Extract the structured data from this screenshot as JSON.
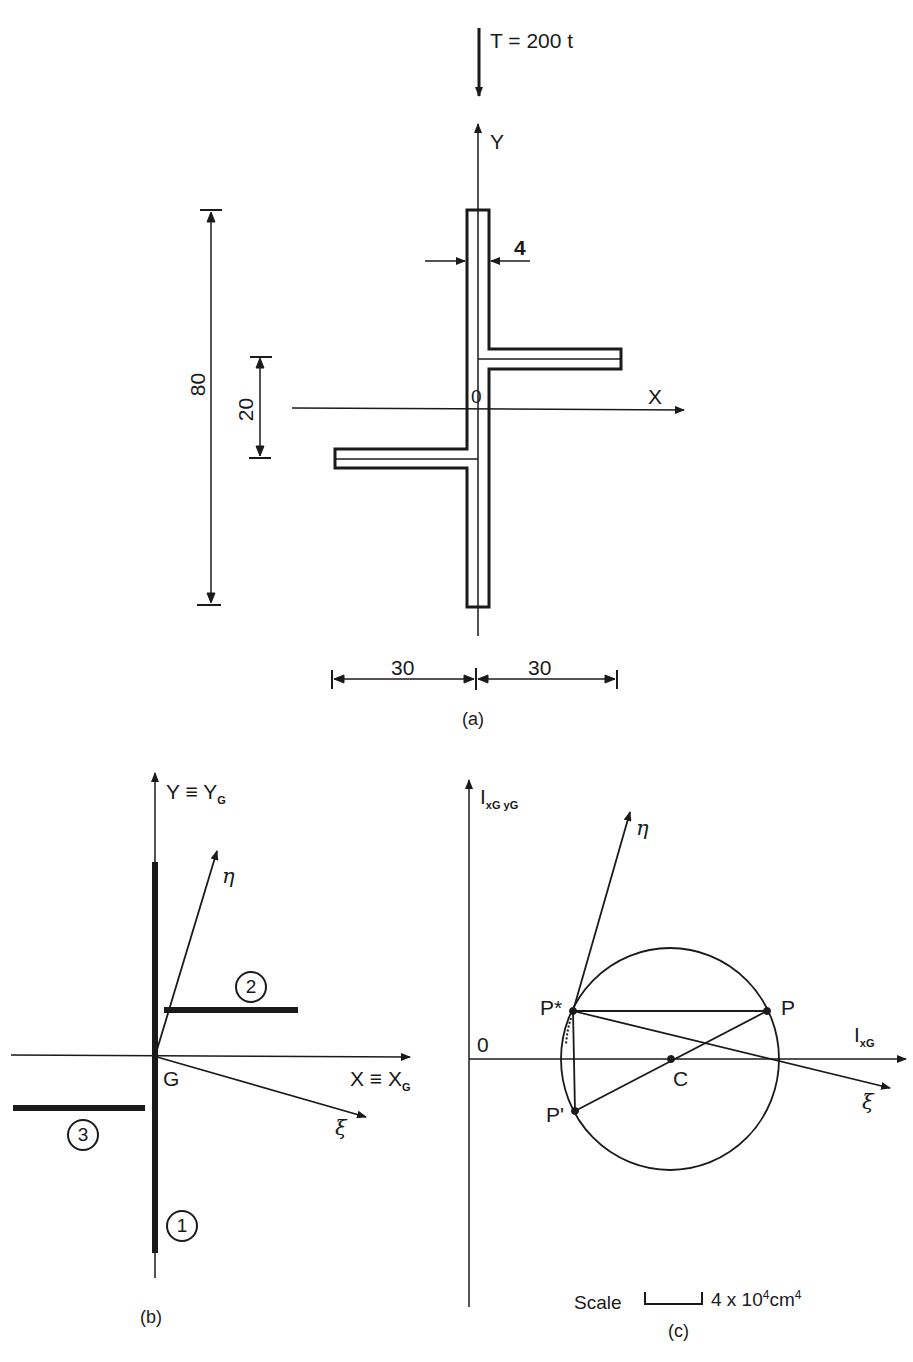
{
  "figure_a": {
    "load_label": "T = 200 t",
    "y_axis": "Y",
    "x_axis": "X",
    "origin": "0",
    "dim_thickness": "4",
    "dim_height_total": "80",
    "dim_flange_offset": "20",
    "dim_left_width": "30",
    "dim_right_width": "30",
    "caption": "(a)"
  },
  "figure_b": {
    "y_axis_main": "Y ≡ Y",
    "y_axis_sub": "G",
    "x_axis_main": "X ≡ X",
    "x_axis_sub": "G",
    "centroid": "G",
    "eta": "η",
    "xi": "ξ",
    "element_1": "1",
    "element_2": "2",
    "element_3": "3",
    "caption": "(b)"
  },
  "figure_c": {
    "y_axis_main": "I",
    "y_axis_sub": "xG yG",
    "x_axis_main": "I",
    "x_axis_sub": "xG",
    "origin": "0",
    "eta": "η",
    "xi": "ξ",
    "point_p": "P",
    "point_p_star": "P*",
    "point_p_prime": "P'",
    "center": "C",
    "scale_label": "Scale",
    "scale_value": "4 x 10",
    "scale_exp": "4",
    "scale_unit": "cm",
    "scale_unit_exp": "4",
    "caption": "(c)"
  }
}
